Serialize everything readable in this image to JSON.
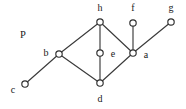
{
  "figure": {
    "width": 186,
    "height": 109,
    "background_color": "#ffffff",
    "stroke_color": "#3a3a3a",
    "node_fill_color": "#ffffff",
    "node_stroke_color": "#2e2e2e",
    "text_color": "#1a1a1a"
  },
  "poset_label": {
    "text": "P",
    "x": 23,
    "y": 35
  },
  "nodes": [
    {
      "id": "h",
      "label": "h",
      "x": 100,
      "y": 22,
      "r": 3.2,
      "label_x": 100,
      "label_y": 8
    },
    {
      "id": "f",
      "label": "f",
      "x": 133,
      "y": 23,
      "r": 3.2,
      "label_x": 133,
      "label_y": 8
    },
    {
      "id": "g",
      "label": "g",
      "x": 171,
      "y": 22,
      "r": 3.2,
      "label_x": 171,
      "label_y": 8
    },
    {
      "id": "b",
      "label": "b",
      "x": 59,
      "y": 54,
      "r": 3.2,
      "label_x": 46,
      "label_y": 53
    },
    {
      "id": "e",
      "label": "e",
      "x": 100,
      "y": 53,
      "r": 3.2,
      "label_x": 113,
      "label_y": 54
    },
    {
      "id": "a",
      "label": "a",
      "x": 133,
      "y": 53,
      "r": 3.2,
      "label_x": 146,
      "label_y": 55
    },
    {
      "id": "c",
      "label": "c",
      "x": 25,
      "y": 84,
      "r": 3.2,
      "label_x": 13,
      "label_y": 90
    },
    {
      "id": "d",
      "label": "d",
      "x": 100,
      "y": 83,
      "r": 3.2,
      "label_x": 100,
      "label_y": 99
    }
  ],
  "edges": [
    {
      "from": "h",
      "to": "b",
      "x1": 100,
      "y1": 22,
      "x2": 59,
      "y2": 54
    },
    {
      "from": "h",
      "to": "e",
      "x1": 100,
      "y1": 22,
      "x2": 100,
      "y2": 53
    },
    {
      "from": "h",
      "to": "a",
      "x1": 100,
      "y1": 22,
      "x2": 133,
      "y2": 53
    },
    {
      "from": "b",
      "to": "d",
      "x1": 59,
      "y1": 54,
      "x2": 100,
      "y2": 83
    },
    {
      "from": "e",
      "to": "d",
      "x1": 100,
      "y1": 53,
      "x2": 100,
      "y2": 83
    },
    {
      "from": "a",
      "to": "d",
      "x1": 133,
      "y1": 53,
      "x2": 100,
      "y2": 83
    },
    {
      "from": "b",
      "to": "c",
      "x1": 59,
      "y1": 54,
      "x2": 25,
      "y2": 84
    },
    {
      "from": "a",
      "to": "f",
      "x1": 133,
      "y1": 53,
      "x2": 133,
      "y2": 23
    },
    {
      "from": "a",
      "to": "g",
      "x1": 133,
      "y1": 53,
      "x2": 171,
      "y2": 22
    }
  ]
}
